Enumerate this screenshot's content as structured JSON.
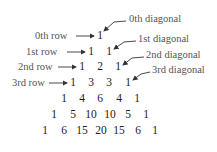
{
  "diagram": {
    "row_labels": [
      "0th row",
      "1st row",
      "2nd row",
      "3rd row"
    ],
    "diagonal_labels": [
      "0th diagonal",
      "1st diagonal",
      "2nd diagonal",
      "3rd diagonal"
    ],
    "rows": [
      [
        "1"
      ],
      [
        "1",
        "1"
      ],
      [
        "1",
        "2",
        "1"
      ],
      [
        "1",
        "3",
        "3",
        "1"
      ],
      [
        "1",
        "4",
        "6",
        "4",
        "1"
      ],
      [
        "1",
        "5",
        "10",
        "10",
        "5",
        "1"
      ],
      [
        "1",
        "6",
        "15",
        "20",
        "15",
        "6",
        "1"
      ]
    ],
    "colors": {
      "text": "#222222",
      "label": "#555555",
      "arrow": "#333333"
    }
  }
}
